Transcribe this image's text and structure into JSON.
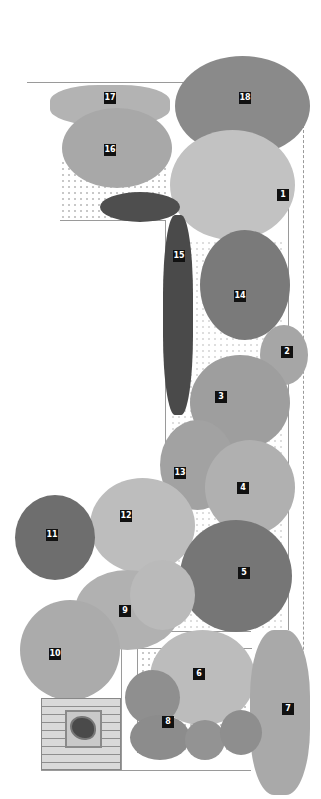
{
  "diagram": {
    "type": "garden planting plan",
    "style": "grayscale illustration",
    "labels": [
      {
        "id": "1",
        "text": "1",
        "x": 283,
        "y": 195
      },
      {
        "id": "2",
        "text": "2",
        "x": 287,
        "y": 352
      },
      {
        "id": "3",
        "text": "3",
        "x": 221,
        "y": 397
      },
      {
        "id": "4",
        "text": "4",
        "x": 243,
        "y": 488
      },
      {
        "id": "5",
        "text": "5",
        "x": 244,
        "y": 573
      },
      {
        "id": "6",
        "text": "6",
        "x": 199,
        "y": 674
      },
      {
        "id": "7",
        "text": "7",
        "x": 288,
        "y": 709
      },
      {
        "id": "8",
        "text": "8",
        "x": 168,
        "y": 722
      },
      {
        "id": "9",
        "text": "9",
        "x": 125,
        "y": 611
      },
      {
        "id": "10",
        "text": "10",
        "x": 55,
        "y": 654
      },
      {
        "id": "11",
        "text": "11",
        "x": 52,
        "y": 535
      },
      {
        "id": "12",
        "text": "12",
        "x": 126,
        "y": 516
      },
      {
        "id": "13",
        "text": "13",
        "x": 180,
        "y": 473
      },
      {
        "id": "14",
        "text": "14",
        "x": 240,
        "y": 296
      },
      {
        "id": "15",
        "text": "15",
        "x": 179,
        "y": 256
      },
      {
        "id": "16",
        "text": "16",
        "x": 110,
        "y": 150
      },
      {
        "id": "17",
        "text": "17",
        "x": 110,
        "y": 98
      },
      {
        "id": "18",
        "text": "18",
        "x": 245,
        "y": 98
      }
    ],
    "colors": {
      "label_bg": "#111111",
      "label_text": "#ffffff",
      "foliage_light": "#bdbdbd",
      "foliage_mid": "#9c9c9c",
      "foliage_dark": "#5e5e5e",
      "border_line": "#9a9a9a"
    }
  }
}
